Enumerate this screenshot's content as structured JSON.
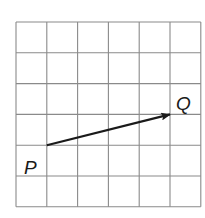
{
  "diagram": {
    "type": "vector-on-grid",
    "grid": {
      "columns": 6,
      "rows": 6,
      "origin_px": [
        16,
        22
      ],
      "cell_px": 30.8,
      "line_color": "#8a8a8a"
    },
    "vector": {
      "from": {
        "label": "P",
        "grid": [
          1,
          4
        ]
      },
      "to": {
        "label": "Q",
        "grid": [
          5,
          3
        ]
      },
      "color": "#1a1a1a"
    },
    "labels": {
      "P": "P",
      "Q": "Q"
    }
  }
}
